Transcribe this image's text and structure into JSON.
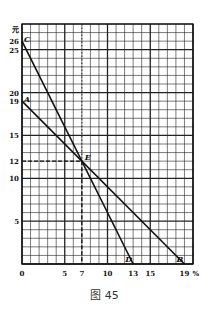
{
  "chart_data": {
    "type": "line",
    "title": "",
    "caption": "图 45",
    "xlabel": "%",
    "ylabel": "元",
    "xlim": [
      0,
      20
    ],
    "ylim": [
      0,
      28
    ],
    "grid": true,
    "x_ticks": [
      0,
      5,
      7,
      10,
      13,
      15,
      19
    ],
    "y_ticks": [
      5,
      10,
      12,
      15,
      19,
      20,
      25,
      26
    ],
    "series": [
      {
        "name": "CD",
        "points": [
          [
            0,
            26
          ],
          [
            13,
            0
          ]
        ],
        "labels": [
          "C",
          "D"
        ]
      },
      {
        "name": "AB",
        "points": [
          [
            0,
            19
          ],
          [
            19,
            0
          ]
        ],
        "labels": [
          "A",
          "B"
        ]
      }
    ],
    "annotations": [
      {
        "label": "E",
        "x": 7,
        "y": 12,
        "note": "intersection point; dashed guides to axes"
      }
    ]
  },
  "figure": {
    "caption": "图 45",
    "y_unit": "元",
    "x_unit": "%",
    "origin_label": "0",
    "point_labels": {
      "A": "A",
      "B": "B",
      "C": "C",
      "D": "D",
      "E": "E"
    }
  }
}
